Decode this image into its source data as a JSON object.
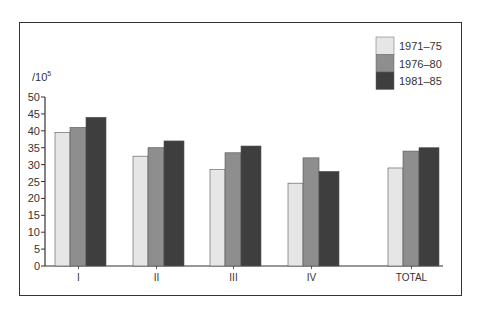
{
  "chart_data": {
    "type": "bar",
    "title": "",
    "xlabel": "",
    "ylabel": "/10^5",
    "unit_label": {
      "base": "/10",
      "exponent": "5"
    },
    "ylim": [
      0,
      50
    ],
    "yticks": [
      0,
      5,
      10,
      15,
      20,
      25,
      30,
      35,
      40,
      45,
      50
    ],
    "grid": false,
    "legend_position": "top-right",
    "categories": [
      "I",
      "II",
      "III",
      "IV",
      "TOTAL"
    ],
    "series": [
      {
        "name": "1971–75",
        "color": "#e6e6e6",
        "values": [
          39.5,
          32.5,
          28.5,
          24.5,
          29
        ]
      },
      {
        "name": "1976–80",
        "color": "#8e8e8e",
        "values": [
          41,
          35,
          33.5,
          32,
          34
        ]
      },
      {
        "name": "1981–85",
        "color": "#3e3e3e",
        "values": [
          44,
          37,
          35.5,
          28,
          35
        ]
      }
    ]
  }
}
